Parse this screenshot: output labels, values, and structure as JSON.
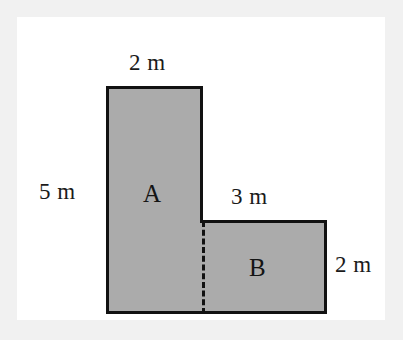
{
  "figure": {
    "unit": "m",
    "fill_color": "#ababab",
    "stroke_color": "#111111",
    "panel_color": "#ffffff",
    "page_color": "#f1f1f1"
  },
  "labels": {
    "top_width": "2 m",
    "left_height": "5 m",
    "inner_top_width": "3 m",
    "right_height": "2 m",
    "region_a": "A",
    "region_b": "B"
  },
  "chart_data": {
    "type": "diagram",
    "shape": "L-shape composed of two rectangles",
    "unit": "m",
    "rectangles": [
      {
        "name": "A",
        "label": "A",
        "width": 2,
        "height": 5,
        "width_label": "2 m",
        "height_label": "5 m",
        "position": "left-tall"
      },
      {
        "name": "B",
        "label": "B",
        "width": 3,
        "height": 2,
        "width_label": "3 m",
        "height_label": "2 m",
        "position": "bottom-right"
      }
    ],
    "annotations": [
      {
        "text": "2 m",
        "edge": "top",
        "applies_to": "A"
      },
      {
        "text": "5 m",
        "edge": "left",
        "applies_to": "A"
      },
      {
        "text": "3 m",
        "edge": "top",
        "applies_to": "B"
      },
      {
        "text": "2 m",
        "edge": "right",
        "applies_to": "B"
      }
    ],
    "divider": {
      "style": "dashed",
      "orientation": "vertical",
      "between": [
        "A",
        "B"
      ]
    },
    "grid": false,
    "legend": false
  }
}
